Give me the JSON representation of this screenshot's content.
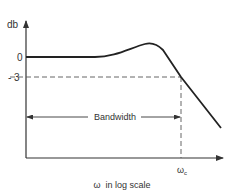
{
  "diagram": {
    "type": "frequency-response-bandwidth",
    "y_axis": {
      "label": "db",
      "ticks": [
        "0",
        "- 3"
      ]
    },
    "x_axis": {
      "label": "ω  in log scale",
      "marker": "ω",
      "marker_subscript": "c"
    },
    "annotation": {
      "bandwidth_label": "Bandwidth"
    },
    "colors": {
      "curve": "#222222",
      "axes": "#333333",
      "dashed": "#555555",
      "text": "#333333"
    }
  }
}
